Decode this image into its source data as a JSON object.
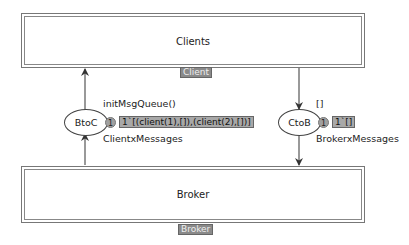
{
  "transitions": [
    {
      "id": "clients",
      "label": "Clients",
      "tag": "Client"
    },
    {
      "id": "broker",
      "label": "Broker",
      "tag": "Broker"
    }
  ],
  "places": [
    {
      "id": "btoc",
      "label": "BtoC",
      "type": "ClientxMessages",
      "init": "initMsgQueue()",
      "count": "1",
      "marking": "1`[(client(1),[]),(client(2),[])]"
    },
    {
      "id": "ctob",
      "label": "CtoB",
      "type": "BrokerxMessages",
      "init": "[]",
      "count": "1",
      "marking": "1`[]"
    }
  ],
  "arcs": [
    {
      "from": "btoc",
      "to": "clients"
    },
    {
      "from": "broker",
      "to": "btoc"
    },
    {
      "from": "clients",
      "to": "ctob"
    },
    {
      "from": "ctob",
      "to": "broker"
    }
  ]
}
